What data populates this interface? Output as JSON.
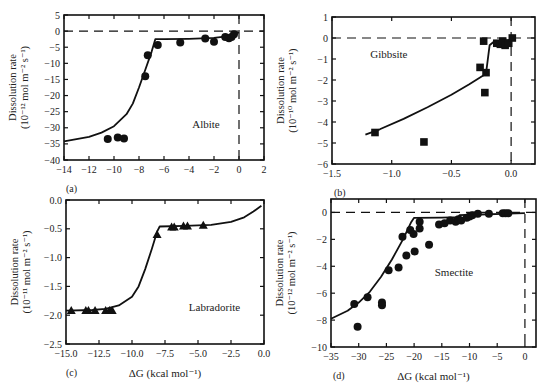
{
  "chart_data": [
    {
      "id": "a",
      "type": "scatter",
      "panel_label": "(a)",
      "mineral": "Albite",
      "marker": "circle",
      "xlabel": "",
      "ylabel_line1": "Dissolution rate",
      "ylabel_line2": "(10⁻¹² mol m⁻² s⁻¹)",
      "xlim": [
        -14,
        2
      ],
      "ylim": [
        -40,
        5
      ],
      "xticks": [
        -14,
        -12,
        -10,
        -8,
        -6,
        -4,
        -2,
        0,
        2
      ],
      "yticks": [
        5,
        0,
        -5,
        -10,
        -15,
        -20,
        -25,
        -30,
        -35,
        -40
      ],
      "reference_lines": {
        "horizontal_dashed_y": 0,
        "vertical_dashed_x": 0
      },
      "points": [
        [
          -10.5,
          -33.5
        ],
        [
          -9.7,
          -33.0
        ],
        [
          -9.2,
          -33.3
        ],
        [
          -7.5,
          -14.0
        ],
        [
          -7.3,
          -7.5
        ],
        [
          -6.5,
          -4.3
        ],
        [
          -4.7,
          -3.5
        ],
        [
          -2.7,
          -2.3
        ],
        [
          -2.0,
          -3.3
        ],
        [
          -1.1,
          -1.8
        ],
        [
          -0.8,
          -2.2
        ],
        [
          -0.6,
          -1.8
        ],
        [
          -0.4,
          -1.0
        ]
      ],
      "fit_curve": [
        [
          -14,
          -34.2
        ],
        [
          -12,
          -32.8
        ],
        [
          -11,
          -31.5
        ],
        [
          -10,
          -29.5
        ],
        [
          -9,
          -25.8
        ],
        [
          -8.5,
          -22.5
        ],
        [
          -8,
          -17.5
        ],
        [
          -7.5,
          -12
        ],
        [
          -7,
          -6.5
        ],
        [
          -6.7,
          -2.5
        ],
        [
          -6,
          -2.5
        ],
        [
          -4,
          -2.4
        ],
        [
          -2,
          -2.1
        ],
        [
          -1,
          -1.6
        ],
        [
          -0.5,
          -1.1
        ],
        [
          0,
          -0.4
        ]
      ]
    },
    {
      "id": "b",
      "type": "scatter",
      "panel_label": "(b)",
      "mineral": "Gibbsite",
      "marker": "square",
      "xlabel": "",
      "ylabel_line1": "Dissolution rate",
      "ylabel_line2": "(10⁻¹⁰ mol m⁻² s⁻¹)",
      "xlim": [
        -1.5,
        0.2
      ],
      "ylim": [
        -6,
        1
      ],
      "xticks": [
        -1.5,
        -1.0,
        -0.5,
        0.0
      ],
      "xtick_labels": [
        "−1.5",
        "−1.0",
        "−0.5",
        "0.0"
      ],
      "yticks": [
        1,
        0,
        -1,
        -2,
        -3,
        -4,
        -5,
        -6
      ],
      "reference_lines": {
        "horizontal_dashed_y": 0,
        "vertical_dashed_x": 0
      },
      "points": [
        [
          -1.14,
          -4.5
        ],
        [
          -0.73,
          -4.95
        ],
        [
          -0.26,
          -1.4
        ],
        [
          -0.23,
          -0.15
        ],
        [
          -0.22,
          -2.6
        ],
        [
          -0.21,
          -1.65
        ],
        [
          -0.12,
          -0.25
        ],
        [
          -0.09,
          -0.3
        ],
        [
          -0.07,
          -0.15
        ],
        [
          -0.05,
          -0.35
        ],
        [
          -0.02,
          -0.25
        ],
        [
          0.01,
          0.0
        ]
      ],
      "fit_curve": [
        [
          -1.22,
          -4.6
        ],
        [
          -1.1,
          -4.35
        ],
        [
          -0.9,
          -3.85
        ],
        [
          -0.7,
          -3.3
        ],
        [
          -0.5,
          -2.7
        ],
        [
          -0.35,
          -2.2
        ],
        [
          -0.21,
          -1.7
        ],
        [
          -0.18,
          -0.35
        ],
        [
          -0.15,
          -0.2
        ],
        [
          -0.1,
          -0.18
        ],
        [
          -0.05,
          -0.12
        ],
        [
          0,
          -0.08
        ]
      ]
    },
    {
      "id": "c",
      "type": "scatter",
      "panel_label": "(c)",
      "mineral": "Labradorite",
      "marker": "triangle",
      "xlabel": "ΔG (kcal mol⁻¹)",
      "ylabel_line1": "Dissolution rate",
      "ylabel_line2": "(10⁻¹¹ mol m⁻² s⁻¹)",
      "xlim": [
        -15,
        0
      ],
      "ylim": [
        -2.5,
        0
      ],
      "xticks": [
        -15,
        -12.5,
        -10,
        -7.5,
        -5,
        -2.5,
        0
      ],
      "xtick_labels": [
        "−15.0",
        "−12.5",
        "−10.0",
        "−7.5",
        "−5.0",
        "−2.5",
        "0.0"
      ],
      "yticks": [
        0,
        -0.5,
        -1,
        -1.5,
        -2,
        -2.5
      ],
      "ytick_labels": [
        "0.0",
        "−0.5",
        "−1.0",
        "−1.5",
        "−2.0",
        "−2.5"
      ],
      "reference_lines": {},
      "points": [
        [
          -14.6,
          -1.92
        ],
        [
          -13.5,
          -1.92
        ],
        [
          -13.3,
          -1.92
        ],
        [
          -12.8,
          -1.92
        ],
        [
          -12.0,
          -1.92
        ],
        [
          -11.7,
          -1.92
        ],
        [
          -11.5,
          -1.92
        ],
        [
          -8.1,
          -0.6
        ],
        [
          -7.0,
          -0.47
        ],
        [
          -6.8,
          -0.47
        ],
        [
          -6.1,
          -0.45
        ],
        [
          -5.8,
          -0.45
        ],
        [
          -4.6,
          -0.44
        ]
      ],
      "fit_curve": [
        [
          -15,
          -1.92
        ],
        [
          -13,
          -1.91
        ],
        [
          -12,
          -1.89
        ],
        [
          -11,
          -1.83
        ],
        [
          -10,
          -1.68
        ],
        [
          -9.5,
          -1.5
        ],
        [
          -9,
          -1.2
        ],
        [
          -8.5,
          -0.85
        ],
        [
          -8.1,
          -0.55
        ],
        [
          -7.9,
          -0.46
        ],
        [
          -6,
          -0.45
        ],
        [
          -4,
          -0.43
        ],
        [
          -2.5,
          -0.38
        ],
        [
          -1.5,
          -0.3
        ],
        [
          -0.8,
          -0.2
        ],
        [
          -0.2,
          -0.1
        ]
      ]
    },
    {
      "id": "d",
      "type": "scatter",
      "panel_label": "(d)",
      "mineral": "Smectite",
      "marker": "circle",
      "xlabel": "ΔG (kcal mol⁻¹)",
      "ylabel_line1": "Dissolution rate",
      "ylabel_line2": "(10⁻¹² mol m⁻² s⁻¹)",
      "xlim": [
        -35,
        2
      ],
      "ylim": [
        -10,
        1
      ],
      "xticks": [
        -35,
        -30,
        -25,
        -20,
        -15,
        -10,
        -5,
        0
      ],
      "yticks": [
        0,
        -2,
        -4,
        -6,
        -8,
        -10
      ],
      "reference_lines": {
        "horizontal_dashed_y": 0,
        "vertical_dashed_x": 0
      },
      "points": [
        [
          -30.8,
          -6.8
        ],
        [
          -30.2,
          -8.5
        ],
        [
          -28.4,
          -6.3
        ],
        [
          -25.8,
          -6.7
        ],
        [
          -25.8,
          -6.9
        ],
        [
          -24.6,
          -4.3
        ],
        [
          -22.8,
          -4.1
        ],
        [
          -22.1,
          -1.8
        ],
        [
          -21.4,
          -3.2
        ],
        [
          -20.7,
          -1.3
        ],
        [
          -20.1,
          -1.6
        ],
        [
          -19.9,
          -2.9
        ],
        [
          -19.0,
          -0.7
        ],
        [
          -19.0,
          -1.2
        ],
        [
          -17.3,
          -2.4
        ],
        [
          -15.5,
          -0.9
        ],
        [
          -14.5,
          -0.8
        ],
        [
          -13.5,
          -0.6
        ],
        [
          -12.5,
          -0.7
        ],
        [
          -12.0,
          -0.5
        ],
        [
          -11.5,
          -0.6
        ],
        [
          -10.5,
          -0.4
        ],
        [
          -10.0,
          -0.3
        ],
        [
          -9.5,
          -0.2
        ],
        [
          -8.5,
          -0.1
        ],
        [
          -6.5,
          -0.1
        ],
        [
          -4.0,
          -0.05
        ],
        [
          -3.5,
          -0.05
        ],
        [
          -3.0,
          -0.05
        ]
      ],
      "fit_curve": [
        [
          -35,
          -7.9
        ],
        [
          -32,
          -7.3
        ],
        [
          -30,
          -6.7
        ],
        [
          -28,
          -5.9
        ],
        [
          -26,
          -4.8
        ],
        [
          -24,
          -3.5
        ],
        [
          -22,
          -2.0
        ],
        [
          -20.5,
          -0.7
        ],
        [
          -20,
          -0.4
        ],
        [
          -15,
          -0.38
        ],
        [
          -12,
          -0.35
        ],
        [
          -11.8,
          -0.2
        ],
        [
          -8,
          -0.15
        ],
        [
          -4,
          -0.1
        ],
        [
          0,
          -0.05
        ]
      ]
    }
  ]
}
